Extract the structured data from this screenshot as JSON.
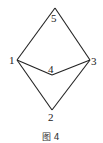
{
  "figure": {
    "caption": "图 4",
    "vertices": [
      {
        "id": "1",
        "label": "1",
        "x": 17,
        "y": 60
      },
      {
        "id": "2",
        "label": "2",
        "x": 52,
        "y": 110
      },
      {
        "id": "3",
        "label": "3",
        "x": 90,
        "y": 60
      },
      {
        "id": "4",
        "label": "4",
        "x": 52,
        "y": 75
      },
      {
        "id": "5",
        "label": "5",
        "x": 55,
        "y": 8
      }
    ],
    "edges": [
      [
        "1",
        "5"
      ],
      [
        "5",
        "3"
      ],
      [
        "1",
        "4"
      ],
      [
        "4",
        "3"
      ],
      [
        "1",
        "2"
      ],
      [
        "2",
        "3"
      ]
    ],
    "line_color": "#222222"
  }
}
